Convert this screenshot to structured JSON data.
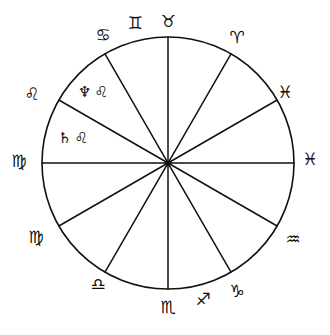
{
  "figure": {
    "type": "astrological-chart-wheel",
    "title": "",
    "background_color": "#ffffff",
    "line_color": "#111111",
    "circle": {
      "center_x": 168,
      "center_y": 163,
      "radius": 126,
      "spoke_count": 12,
      "spoke_spacing_degrees": 30
    }
  },
  "chart_data": {
    "type": "pie",
    "title": "",
    "xlabel": "",
    "ylabel": "",
    "legend_position": "none",
    "grid": false,
    "categories": [
      "House 1",
      "House 2",
      "House 3",
      "House 4",
      "House 5",
      "House 6",
      "House 7",
      "House 8",
      "House 9",
      "House 10",
      "House 11",
      "House 12"
    ],
    "values": [
      30,
      30,
      30,
      30,
      30,
      30,
      30,
      30,
      30,
      30,
      30,
      30
    ],
    "cusp_labels": [
      "♋",
      "♊",
      "♉",
      "♌",
      "♌",
      "♍",
      "♍",
      "♎",
      "♏",
      "♑",
      "♒",
      "♓"
    ]
  },
  "rim_labels": [
    {
      "id": "taurus-top",
      "glyph": "♉",
      "name": "taurus",
      "x": 168,
      "y": 22,
      "angle_deg": 90
    },
    {
      "id": "gemini-top",
      "glyph": "♊",
      "name": "gemini",
      "x": 135,
      "y": 24,
      "angle_deg": 105
    },
    {
      "id": "cancer-top",
      "glyph": "♋",
      "name": "cancer",
      "x": 103,
      "y": 36,
      "angle_deg": 120
    },
    {
      "id": "aries-upper-right",
      "glyph": "♈",
      "name": "aries",
      "x": 237,
      "y": 38,
      "angle_deg": 60
    },
    {
      "id": "pisces-upper-right",
      "glyph": "♓",
      "name": "pisces",
      "x": 285,
      "y": 93,
      "angle_deg": 30
    },
    {
      "id": "pisces-right",
      "glyph": "♓",
      "name": "pisces",
      "x": 310,
      "y": 160,
      "angle_deg": 0
    },
    {
      "id": "aquarius-lower-right",
      "glyph": "♒",
      "name": "aquarius",
      "x": 293,
      "y": 240,
      "angle_deg": -30
    },
    {
      "id": "capricorn-bottom-right",
      "glyph": "♑",
      "name": "capricorn",
      "x": 237,
      "y": 292,
      "angle_deg": -60
    },
    {
      "id": "sagittarius-bottom",
      "glyph": "♐",
      "name": "sagittarius",
      "x": 203,
      "y": 300,
      "angle_deg": -75
    },
    {
      "id": "scorpio-bottom",
      "glyph": "♏",
      "name": "scorpio",
      "x": 168,
      "y": 308,
      "angle_deg": -90
    },
    {
      "id": "libra-bottom-left",
      "glyph": "♎",
      "name": "libra",
      "x": 98,
      "y": 285,
      "angle_deg": -120
    },
    {
      "id": "virgo-lower-left",
      "glyph": "♍",
      "name": "virgo",
      "x": 36,
      "y": 238,
      "angle_deg": -150
    },
    {
      "id": "virgo-left",
      "glyph": "♍",
      "name": "virgo",
      "x": 19,
      "y": 162,
      "angle_deg": 180
    },
    {
      "id": "leo-upper-left",
      "glyph": "♌",
      "name": "leo",
      "x": 32,
      "y": 95,
      "angle_deg": 150
    }
  ],
  "placements": [
    {
      "id": "neptune-in-leo",
      "planet_glyph": "♆",
      "planet_name": "neptune",
      "sign_glyph": "♌",
      "sign_name": "leo",
      "x": 78,
      "y": 84
    },
    {
      "id": "saturn-in-leo",
      "planet_glyph": "♄",
      "planet_name": "saturn",
      "sign_glyph": "♌",
      "sign_name": "leo",
      "x": 58,
      "y": 130
    }
  ],
  "caption": {
    "text": "",
    "visible": false
  }
}
